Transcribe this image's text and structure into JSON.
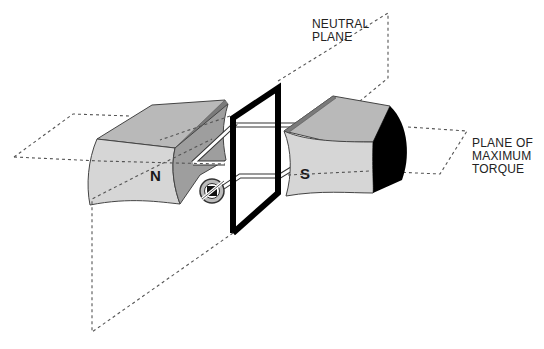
{
  "labels": {
    "neutral_plane": [
      "NEUTRAL",
      "PLANE"
    ],
    "max_torque_plane": [
      "PLANE OF",
      "MAXIMUM",
      "TORQUE"
    ],
    "north_pole": "N",
    "south_pole": "S"
  },
  "colors": {
    "background": "#ffffff",
    "magnet_face": "#d4d4d4",
    "magnet_side": "#a8a8a8",
    "magnet_dark_side": "#000000",
    "coil": "#000000",
    "dashed_plane": "#555555",
    "text": "#222222"
  },
  "components": [
    {
      "name": "north-magnet",
      "label": "N"
    },
    {
      "name": "south-magnet",
      "label": "S"
    },
    {
      "name": "armature-coil"
    },
    {
      "name": "commutator"
    },
    {
      "name": "neutral-plane"
    },
    {
      "name": "plane-of-maximum-torque"
    }
  ]
}
